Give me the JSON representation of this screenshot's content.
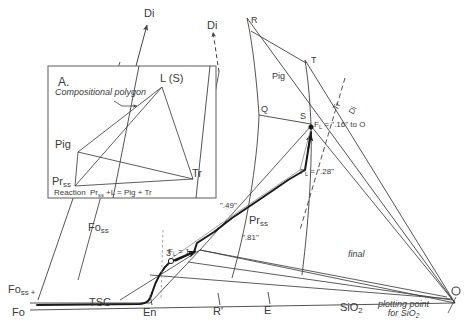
{
  "figure": {
    "type": "phase-diagram",
    "system": "Fo - En - SiO2 - Di pseudoternary liquidus projection",
    "stroke_color": "#3f3f3f",
    "text_color": "#3a3a3a",
    "bold_path_color": "#1a1a1a"
  },
  "inset": {
    "panel_label": "A.",
    "annotation": "Compositional polygon",
    "vertices": {
      "top": "L (S)",
      "left": "Pig",
      "bottom_left": "Pr",
      "bottom_left_sub": "ss",
      "right": "Tr"
    },
    "reaction_prefix": "Reaction",
    "reaction": "Pr",
    "reaction_sub": "ss",
    "reaction_rest": "+L = Pig + Tr"
  },
  "apex_labels": {
    "di_solid": "Di",
    "di_dashed": "Di"
  },
  "field_labels": {
    "pig": "Pig",
    "pr_ss": "Pr",
    "pr_ss_sub": "ss",
    "fo_ss_upper": "Fo",
    "fo_ss_upper_sub": "ss",
    "fo_ss_left": "Fo",
    "fo_ss_left_sub": "ss",
    "fo_ss_left_plus": "+",
    "tsc": "TSC"
  },
  "point_labels": {
    "r": "R",
    "t": "T",
    "q": "Q",
    "s": "S",
    "three": "3"
  },
  "axis_labels": {
    "fo": "Fo",
    "en": "En",
    "r_prime": "R'",
    "e": "E",
    "sio2": "SiO",
    "sio2_sub": "2"
  },
  "annotations": {
    "fl_16": {
      "symbol": "F",
      "symbol_sub": "L",
      "text": "= \".16\" to O"
    },
    "fl_28": {
      "symbol": "F",
      "symbol_sub": "L",
      "text": "= \".28\""
    },
    "fl_1": {
      "symbol": "F",
      "symbol_sub": "L",
      "text": "= 1"
    },
    "val_49": "\".49\"",
    "val_81": "\".81\"",
    "final": "final",
    "tie_tr": "Tr",
    "tie_di": "Di",
    "plotting_point_line1": "plotting point",
    "plotting_point_line2": "for SiO",
    "plotting_point_sub": "2"
  }
}
